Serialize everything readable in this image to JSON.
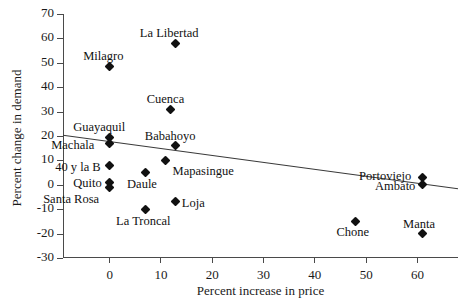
{
  "figure": {
    "top_scrap_text": "",
    "background": "#ffffff",
    "marker_color": "#111111",
    "axis_color": "#4a4a4a"
  },
  "chart_data": {
    "type": "scatter",
    "title": "",
    "xlabel": "Percent increase in price",
    "ylabel": "Percent change in demand",
    "xlim": [
      -9,
      68
    ],
    "ylim": [
      -30,
      70
    ],
    "xticks": [
      0,
      10,
      20,
      30,
      40,
      50,
      60
    ],
    "xtick_labels": [
      "0",
      "10",
      "20",
      "30",
      "40",
      "50",
      "60"
    ],
    "yticks": [
      -30,
      -20,
      -10,
      0,
      10,
      20,
      30,
      40,
      50,
      60,
      70
    ],
    "ytick_labels": [
      "-30",
      "-20",
      "-10",
      "0",
      "10",
      "20",
      "30",
      "40",
      "50",
      "60",
      "70"
    ],
    "grid": false,
    "legend": null,
    "points": [
      {
        "label": "La Libertad",
        "x": 13,
        "y": 58,
        "label_dx": -36,
        "label_dy": -17
      },
      {
        "label": "Milagro",
        "x": 0,
        "y": 48.5,
        "label_dx": -26,
        "label_dy": -17
      },
      {
        "label": "Cuenca",
        "x": 12,
        "y": 31,
        "label_dx": -24,
        "label_dy": -17
      },
      {
        "label": "Guayaquil",
        "x": 0,
        "y": 19.5,
        "label_dx": -36,
        "label_dy": -17
      },
      {
        "label": "Machala",
        "x": 0,
        "y": 17,
        "label_dx": -58,
        "label_dy": -5
      },
      {
        "label": "Babahoyo",
        "x": 13,
        "y": 16,
        "label_dx": -31,
        "label_dy": -17
      },
      {
        "label": "Mapasingue",
        "x": 11,
        "y": 10,
        "label_dx": 7,
        "label_dy": 4
      },
      {
        "label": "40 y la B",
        "x": 0,
        "y": 8,
        "label_dx": -54,
        "label_dy": -5
      },
      {
        "label": "Daule",
        "x": 7,
        "y": 5,
        "label_dx": -18,
        "label_dy": 4
      },
      {
        "label": "Quito",
        "x": 0,
        "y": 1,
        "label_dx": -36,
        "label_dy": -6
      },
      {
        "label": "Santa Rosa",
        "x": 0,
        "y": -1,
        "label_dx": -66,
        "label_dy": 5
      },
      {
        "label": "Portoviejo",
        "x": 61,
        "y": 3,
        "label_dx": -63,
        "label_dy": -8
      },
      {
        "label": "Ambato",
        "x": 61,
        "y": 0,
        "label_dx": -47,
        "label_dy": -6
      },
      {
        "label": "Loja",
        "x": 13,
        "y": -7,
        "label_dx": 6,
        "label_dy": -6
      },
      {
        "label": "La Troncal",
        "x": 7,
        "y": -10,
        "label_dx": -29,
        "label_dy": 5
      },
      {
        "label": "Chone",
        "x": 48,
        "y": -15,
        "label_dx": -19,
        "label_dy": 4
      },
      {
        "label": "Manta",
        "x": 61,
        "y": -20,
        "label_dx": -19,
        "label_dy": -17
      }
    ],
    "trendline": {
      "x_start": -9,
      "y_start": 20.3,
      "x_end": 68,
      "y_end": -1.6
    }
  }
}
